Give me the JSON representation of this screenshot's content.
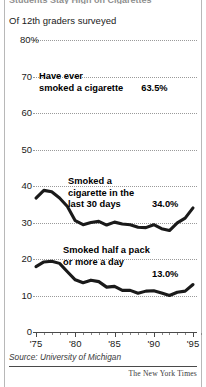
{
  "header": {
    "clipped_headline": "Students Stay High on Cigarettes",
    "kicker": "Of 12th graders surveyed"
  },
  "footer": {
    "source": "Source: University of Michigan",
    "credit": "The New York Times"
  },
  "annotations": [
    {
      "id": "ever-smoked",
      "line1": "Have ever",
      "line2": "smoked a cigarette",
      "value": "63.5%"
    },
    {
      "id": "last-30-days",
      "line1": "Smoked a",
      "line2": "cigarette in the",
      "line3": "last 30 days",
      "value": "34.0%"
    },
    {
      "id": "half-pack",
      "line1": "Smoked half a pack",
      "line2": "or more a day",
      "value": "13.0%"
    }
  ],
  "chart_data": {
    "type": "line",
    "title": "Of 12th graders surveyed",
    "xlabel": "",
    "ylabel": "",
    "ylim": [
      0,
      80
    ],
    "yticks": [
      0,
      10,
      20,
      30,
      40,
      50,
      60,
      70,
      80
    ],
    "ytick_labels": [
      "0",
      "10",
      "20",
      "30",
      "40",
      "50",
      "60",
      "70",
      "80%"
    ],
    "xlim": [
      1975,
      1996
    ],
    "xticks": [
      1975,
      1980,
      1985,
      1990,
      1995
    ],
    "xtick_labels": [
      "'75",
      "'80",
      "'85",
      "'90",
      "'95"
    ],
    "grid": "horizontal-dotted",
    "legend": "inline-annotations",
    "line_color": "#1a1a1a",
    "x": [
      1975,
      1976,
      1977,
      1978,
      1979,
      1980,
      1981,
      1982,
      1983,
      1984,
      1985,
      1986,
      1987,
      1988,
      1989,
      1990,
      1991,
      1992,
      1993,
      1994,
      1995
    ],
    "series": [
      {
        "name": "Smoked a cigarette in the last 30 days",
        "label_value": "34.0%",
        "values": [
          36.7,
          38.8,
          38.4,
          36.7,
          34.4,
          30.5,
          29.4,
          30.0,
          30.3,
          29.3,
          30.1,
          29.6,
          29.4,
          28.7,
          28.6,
          29.4,
          28.3,
          27.8,
          29.9,
          31.2,
          34.0
        ]
      },
      {
        "name": "Smoked half a pack or more a day",
        "label_value": "13.0%",
        "values": [
          17.9,
          19.2,
          19.4,
          18.8,
          16.5,
          14.3,
          13.5,
          14.2,
          13.8,
          12.3,
          12.5,
          11.4,
          11.4,
          10.6,
          11.2,
          11.3,
          10.7,
          10.0,
          10.9,
          11.2,
          13.0
        ]
      }
    ],
    "reference_values": [
      {
        "name": "Have ever smoked a cigarette",
        "value": 63.5,
        "label_value": "63.5%"
      }
    ]
  }
}
